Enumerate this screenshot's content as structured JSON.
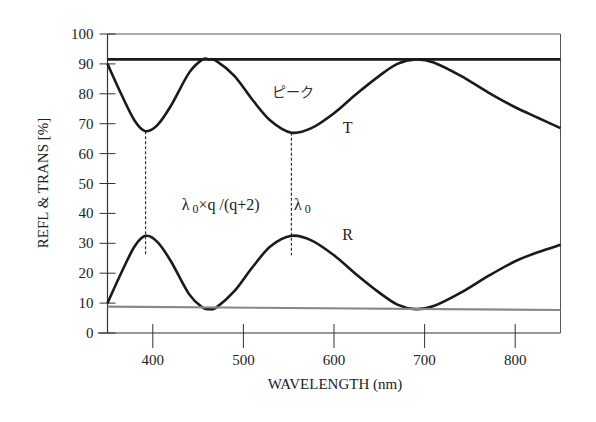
{
  "chart_data": {
    "type": "line",
    "title": "",
    "xlabel": "WAVELENGTH (nm)",
    "ylabel": "REFL & TRANS [%]",
    "xlim": [
      350,
      850
    ],
    "ylim": [
      0,
      100
    ],
    "xticks": [
      400,
      500,
      600,
      700,
      800
    ],
    "yticks": [
      0,
      10,
      20,
      30,
      40,
      50,
      60,
      70,
      80,
      90,
      100
    ],
    "grid": false,
    "legend": "none",
    "series": [
      {
        "name": "T",
        "color": "#1a1a1a",
        "x": [
          350,
          365,
          380,
          392,
          405,
          420,
          440,
          455,
          462,
          470,
          490,
          510,
          530,
          553,
          575,
          600,
          625,
          650,
          670,
          690,
          710,
          740,
          770,
          800,
          825,
          850
        ],
        "values": [
          90,
          80,
          71,
          67.5,
          69.5,
          76,
          87,
          91.5,
          91.5,
          91,
          86,
          78,
          71,
          67,
          68.5,
          73.5,
          80,
          86,
          90,
          91.5,
          90.5,
          86,
          80.5,
          75.5,
          72,
          68.5
        ]
      },
      {
        "name": "R",
        "color": "#1a1a1a",
        "x": [
          350,
          365,
          380,
          392,
          405,
          420,
          440,
          455,
          462,
          470,
          490,
          510,
          530,
          553,
          575,
          600,
          625,
          650,
          670,
          690,
          710,
          740,
          770,
          800,
          825,
          850
        ],
        "values": [
          10,
          20,
          29,
          32.5,
          30.5,
          24,
          13,
          8.5,
          8,
          8.5,
          14,
          22,
          29,
          32.5,
          31,
          26,
          19.5,
          13.5,
          9.5,
          8,
          9,
          13.5,
          19,
          24,
          27,
          29.5
        ]
      },
      {
        "name": "upper reference line",
        "color": "#1a1a1a",
        "x": [
          350,
          850
        ],
        "values": [
          91.5,
          91.5
        ]
      },
      {
        "name": "lower reference line",
        "color": "#888888",
        "x": [
          350,
          850
        ],
        "values": [
          8.8,
          7.7
        ]
      }
    ],
    "annotations": [
      {
        "text": "ピーク",
        "x": 555,
        "y": 79
      },
      {
        "text": "T",
        "x": 615,
        "y": 67
      },
      {
        "text": "R",
        "x": 615,
        "y": 31
      },
      {
        "text": "λ 0×q /(q+2)",
        "x": 475,
        "y": 41
      },
      {
        "text": "λ 0",
        "x": 565,
        "y": 41
      }
    ],
    "vlines": [
      {
        "x": 392,
        "y_from": 67.5,
        "y_to": 26,
        "style": "dashed"
      },
      {
        "x": 553,
        "y_from": 67,
        "y_to": 26,
        "style": "dashed"
      }
    ]
  }
}
